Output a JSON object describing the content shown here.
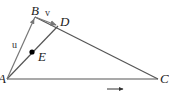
{
  "diagram": {
    "type": "geometry-triangle-vectors",
    "points": {
      "A": {
        "label": "A",
        "x": 7,
        "y": 79
      },
      "B": {
        "label": "B",
        "x": 35,
        "y": 17
      },
      "C": {
        "label": "C",
        "x": 158,
        "y": 79
      },
      "D": {
        "label": "D",
        "x": 58,
        "y": 26
      },
      "E": {
        "label": "E",
        "x": 32,
        "y": 52
      }
    },
    "vectors": {
      "u": {
        "label": "u",
        "from": "A",
        "to": "B"
      },
      "v": {
        "label": "v",
        "from": "B",
        "to": "D"
      }
    },
    "segments": [
      "AB",
      "BC",
      "AC",
      "AD"
    ],
    "bottom_arrow": {
      "symbol": "→"
    },
    "colors": {
      "triangle_line": "#555555",
      "vector_line": "#777777",
      "point": "#000000"
    }
  }
}
